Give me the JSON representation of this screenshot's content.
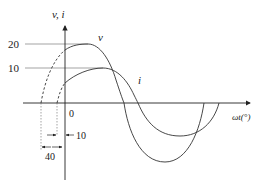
{
  "diagram": {
    "type": "phasor-waveform",
    "axes": {
      "y_label": "v, i",
      "x_label": "ωt(°)",
      "origin_label": "0"
    },
    "levels": [
      {
        "label": "20",
        "value": 20
      },
      {
        "label": "10",
        "value": 10
      }
    ],
    "curves": [
      {
        "name": "v",
        "label": "v",
        "amplitude": 20,
        "phase_lead_deg": 40
      },
      {
        "name": "i",
        "label": "i",
        "amplitude": 10,
        "phase_lead_deg": 10
      }
    ],
    "dimensions": [
      {
        "label": "40",
        "meaning": "v leads by 40°"
      },
      {
        "label": "10",
        "meaning": "i leads by 10°"
      }
    ],
    "colors": {
      "line": "#333333",
      "guide": "#555555"
    }
  }
}
